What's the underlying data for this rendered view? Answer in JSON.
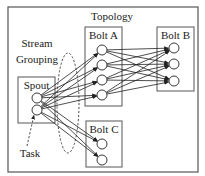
{
  "diagram": {
    "title": "Topology",
    "annotations": {
      "stream_line1": "Stream",
      "stream_line2": "Grouping",
      "task": "Task"
    },
    "components": [
      {
        "id": "spout",
        "label": "Spout",
        "box": [
          18,
          77,
          37,
          46
        ],
        "tasks": [
          [
            37,
            98
          ],
          [
            37,
            110
          ]
        ]
      },
      {
        "id": "boltA",
        "label": "Bolt A",
        "box": [
          85,
          27,
          37,
          79
        ],
        "tasks": [
          [
            102,
            50
          ],
          [
            102,
            65
          ],
          [
            102,
            80
          ],
          [
            102,
            95
          ]
        ]
      },
      {
        "id": "boltB",
        "label": "Bolt B",
        "box": [
          157,
          27,
          37,
          64
        ],
        "tasks": [
          [
            174,
            48
          ],
          [
            174,
            64
          ],
          [
            174,
            81
          ]
        ]
      },
      {
        "id": "boltC",
        "label": "Bolt C",
        "box": [
          86,
          121,
          36,
          46
        ],
        "tasks": [
          [
            102,
            144
          ],
          [
            102,
            160
          ]
        ]
      }
    ],
    "streams": [
      {
        "from": "spout",
        "to": "boltA",
        "grouping": "all-to-all"
      },
      {
        "from": "spout",
        "to": "boltC",
        "grouping": "all-to-all"
      },
      {
        "from": "boltA",
        "to": "boltB",
        "grouping": "all-to-all"
      }
    ],
    "colors": {
      "stroke": "#222222",
      "box_border": "#555555",
      "background": "#ffffff"
    }
  }
}
